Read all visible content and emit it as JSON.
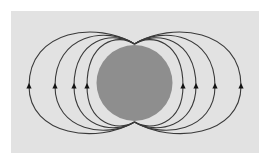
{
  "diagram": {
    "title": "",
    "colors": {
      "page_background": "#ffffff",
      "panel_background": "#e2e2e2",
      "sphere_fill": "#8e8e8e",
      "field_line": "#3a3a3a",
      "arrow": "#111111"
    },
    "panel": {
      "x": 11,
      "y": 11,
      "width": 248,
      "height": 142
    },
    "sphere": {
      "cx": 134.5,
      "cy": 83,
      "r": 38
    },
    "poles": {
      "top": [
        134.5,
        44
      ],
      "bottom": [
        134.5,
        122
      ]
    },
    "field_lines": {
      "arrow_direction": "up",
      "arrow_y": 86,
      "left": [
        {
          "x": 29,
          "top_y": 27,
          "bottom_y": 138
        },
        {
          "x": 55,
          "top_y": 32,
          "bottom_y": 133
        },
        {
          "x": 74,
          "top_y": 36,
          "bottom_y": 129
        },
        {
          "x": 87,
          "top_y": 39,
          "bottom_y": 126
        }
      ],
      "right": [
        {
          "x": 183,
          "top_y": 39,
          "bottom_y": 126
        },
        {
          "x": 196,
          "top_y": 36,
          "bottom_y": 129
        },
        {
          "x": 215,
          "top_y": 32,
          "bottom_y": 133
        },
        {
          "x": 241,
          "top_y": 27,
          "bottom_y": 138
        }
      ]
    }
  }
}
